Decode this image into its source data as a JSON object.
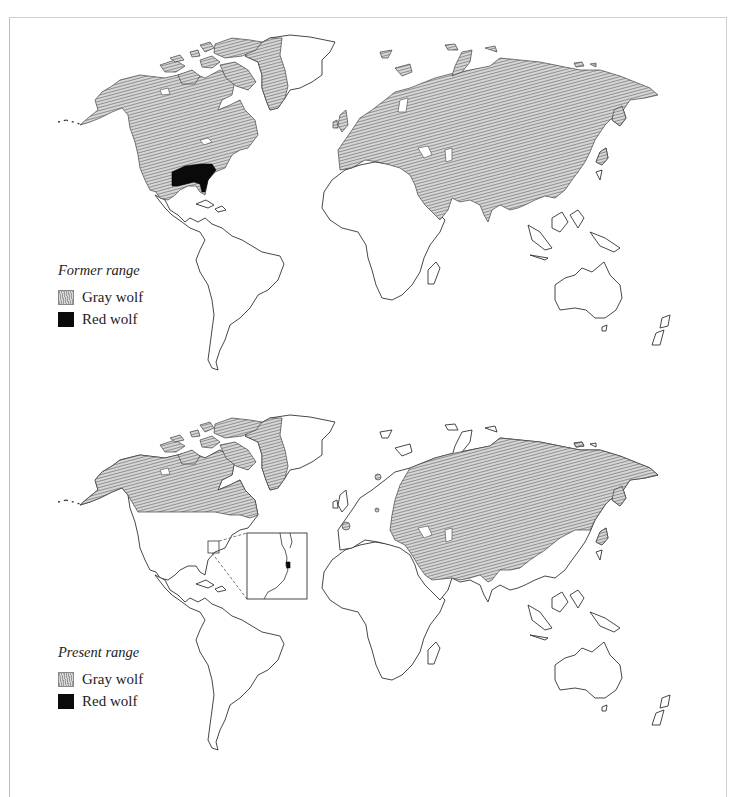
{
  "figure": {
    "panels": [
      {
        "id": "former",
        "legend": {
          "title": "Former range",
          "items": [
            {
              "label": "Gray wolf",
              "color": "#9a9a9a",
              "pattern": "hatched"
            },
            {
              "label": "Red wolf",
              "color": "#0a0a0a",
              "pattern": "solid"
            }
          ]
        },
        "regions": {
          "gray_wolf": [
            "North America (Alaska, Canada, Arctic islands, western & central US, Mexico)",
            "Greenland (coastal)",
            "Europe",
            "Asia (excluding SE Asia)",
            "Arabian Peninsula",
            "Japan"
          ],
          "red_wolf": [
            "Southeastern United States"
          ]
        }
      },
      {
        "id": "present",
        "legend": {
          "title": "Present range",
          "items": [
            {
              "label": "Gray wolf",
              "color": "#9a9a9a",
              "pattern": "hatched"
            },
            {
              "label": "Red wolf",
              "color": "#0a0a0a",
              "pattern": "solid"
            }
          ]
        },
        "regions": {
          "gray_wolf": [
            "Alaska",
            "Canada",
            "Arctic islands",
            "Greenland (coastal)",
            "Eastern Europe",
            "Russia",
            "Central Asia",
            "Middle East",
            "India",
            "China (north/west)",
            "Iberian patch",
            "Scandinavian patch",
            "Italian patch"
          ],
          "red_wolf": [
            "North Carolina coast (inset)"
          ]
        },
        "inset": {
          "label": "North Carolina detail"
        }
      }
    ]
  }
}
